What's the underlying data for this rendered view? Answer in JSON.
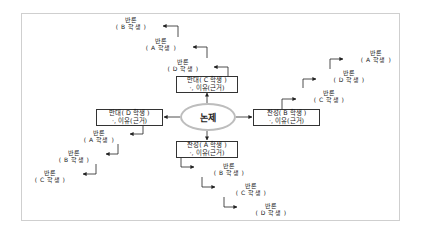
{
  "diagram": {
    "topic": "논제",
    "positions": {
      "top": {
        "line1": "반대( C 학생 )",
        "line2": "·, 이유(근거)"
      },
      "left": {
        "line1": "반대( D 학생 )",
        "line2": "·, 이유(근거)"
      },
      "right": {
        "line1": "찬성( B 학생 )",
        "line2": "·, 이유(근거)"
      },
      "bottom": {
        "line1": "찬성( A 학생 )",
        "line2": "·, 이유(근거)"
      }
    },
    "rebuttals": {
      "top": [
        {
          "label": "반론",
          "who": "( D 학생 )"
        },
        {
          "label": "반론",
          "who": "( A 학생 )"
        },
        {
          "label": "반론",
          "who": "( B 학생 )"
        }
      ],
      "right": [
        {
          "label": "반론",
          "who": "( C 학생 )"
        },
        {
          "label": "반론",
          "who": "( D 학생 )"
        },
        {
          "label": "반론",
          "who": "( A 학생 )"
        }
      ],
      "left": [
        {
          "label": "반론",
          "who": "( A 학생 )"
        },
        {
          "label": "반론",
          "who": "( B 학생 )"
        },
        {
          "label": "반론",
          "who": "( C 학생 )"
        }
      ],
      "bottom": [
        {
          "label": "반론",
          "who": "( B 학생 )"
        },
        {
          "label": "반론",
          "who": "( C 학생 )"
        },
        {
          "label": "반론",
          "who": "( D 학생 )"
        }
      ]
    }
  }
}
